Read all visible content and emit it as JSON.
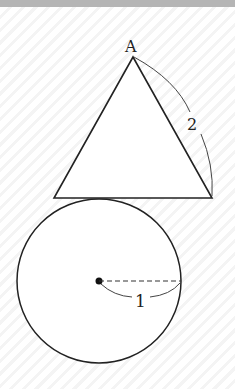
{
  "figure": {
    "vertex_label": "A",
    "side_length_label": "2",
    "radius_label": "1",
    "colors": {
      "stroke": "#222222",
      "band": "#b5b5b5"
    },
    "triangle": {
      "apex": [
        133,
        57
      ],
      "base_left": [
        54,
        198
      ],
      "base_right": [
        212,
        198
      ]
    },
    "circle": {
      "center": [
        99,
        281
      ],
      "radius": 82
    }
  }
}
